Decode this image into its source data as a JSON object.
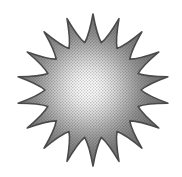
{
  "image": {
    "title": "Sunburst Star Clipart",
    "subject": "sun",
    "style": "grayscale halftone clipart",
    "background_color": "#ffffff",
    "width": 182,
    "height": 177
  },
  "star": {
    "name": "sunburst-star",
    "points": 18,
    "center_x": 93,
    "center_y": 90,
    "outer_radius": 76,
    "inner_radius": 48,
    "rotation_deg": -90,
    "spike_curvature": 0.42,
    "outline_color": "#4a4a4a",
    "outline_width": 1.6
  },
  "gradient": {
    "name": "radial-glow",
    "highlight_x": 88,
    "highlight_y": 88,
    "highlight_radius": 80,
    "stops": [
      {
        "offset": "0%",
        "color": "#ffffff"
      },
      {
        "offset": "12%",
        "color": "#fdfdfd"
      },
      {
        "offset": "24%",
        "color": "#ededed"
      },
      {
        "offset": "38%",
        "color": "#d2d2d2"
      },
      {
        "offset": "52%",
        "color": "#b2b2b2"
      },
      {
        "offset": "66%",
        "color": "#949494"
      },
      {
        "offset": "80%",
        "color": "#7e7e7e"
      },
      {
        "offset": "100%",
        "color": "#6e6e6e"
      }
    ]
  },
  "halftone": {
    "name": "halftone-dot-texture",
    "tile_size": 3,
    "dot_radius": 0.78,
    "dot_color": "#3d3d3d",
    "opacity": 0.3
  }
}
